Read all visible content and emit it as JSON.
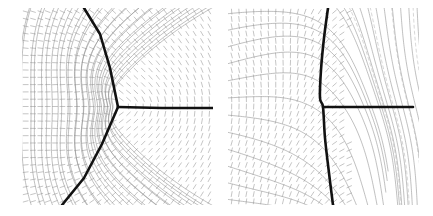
{
  "figure": {
    "title": "",
    "caption": "",
    "background_color": "#ffffff",
    "width": 433,
    "height": 216,
    "panel_count": 2
  },
  "style": {
    "defect_line_color": "#111111",
    "defect_line_width": 2.6,
    "contour_color": "#8c8c8c",
    "contour_width": 0.55,
    "dashed_contour_color": "#b4b4b4",
    "dashed_contour_width": 0.55,
    "dashed_contour_dasharray": "3 3",
    "tick_color": "#8a8a8a",
    "tick_width": 0.5,
    "tick_length": 5
  },
  "panels": [
    {
      "id": "panel-left",
      "label": "",
      "name": "left-panel-triple-junction",
      "x": 22,
      "y": 8,
      "width": 191,
      "height": 197,
      "description": "director line field with a three-fold defect junction",
      "defect": {
        "type": "triple-junction",
        "junction_point": [
          96,
          99
        ],
        "branches": [
          {
            "name": "upper-left-branch",
            "points": [
              [
                96,
                99
              ],
              [
                88,
                60
              ],
              [
                78,
                26
              ],
              [
                62,
                0
              ]
            ]
          },
          {
            "name": "lower-left-branch",
            "points": [
              [
                96,
                99
              ],
              [
                80,
                136
              ],
              [
                62,
                170
              ],
              [
                40,
                197
              ]
            ]
          },
          {
            "name": "right-branch",
            "points": [
              [
                96,
                99
              ],
              [
                140,
                100
              ],
              [
                191,
                100
              ]
            ]
          }
        ]
      },
      "contours": {
        "family": "radial-fan",
        "style": "solid",
        "count": 16
      },
      "line_field": {
        "glyph": "short-segment",
        "grid_nx": 26,
        "grid_ny": 27,
        "orientation_rule": "tangent-to-contours"
      }
    },
    {
      "id": "panel-right",
      "label": "",
      "name": "right-panel-boundary-layer",
      "x": 228,
      "y": 8,
      "width": 191,
      "height": 197,
      "description": "director line field with a near-vertical defect wall and horizontal defect ray",
      "defect": {
        "type": "wall-and-ray",
        "junction_point": [
          95,
          99
        ],
        "branches": [
          {
            "name": "vertical-wall",
            "points": [
              [
                100,
                0
              ],
              [
                96,
                30
              ],
              [
                93,
                62
              ],
              [
                92,
                90
              ],
              [
                95,
                99
              ],
              [
                97,
                130
              ],
              [
                101,
                165
              ],
              [
                105,
                197
              ]
            ]
          },
          {
            "name": "right-ray",
            "points": [
              [
                95,
                99
              ],
              [
                140,
                99
              ],
              [
                185,
                99
              ]
            ]
          }
        ]
      },
      "contours": {
        "family": "vertical-bundle",
        "style": "solid-and-dashed",
        "solid_count": 11,
        "dashed_count": 4
      },
      "line_field": {
        "glyph": "short-segment",
        "grid_nx": 26,
        "grid_ny": 27,
        "orientation_rule": "near-vertical-left-horizontal-right"
      }
    }
  ]
}
